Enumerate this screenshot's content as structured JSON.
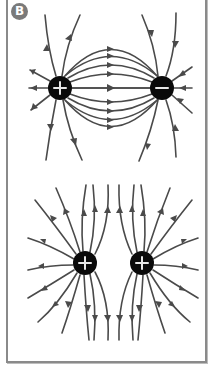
{
  "panel": {
    "label": "B",
    "border_color": "#8a8a8a",
    "badge_color": "#7a7a7a"
  },
  "diagram": {
    "line_color": "#4a4a4a",
    "charge_color": "#0a0a0a",
    "top_configuration": {
      "description": "Opposite charges (dipole)",
      "charges": [
        {
          "sign": "+",
          "x": 60,
          "y": 88
        },
        {
          "sign": "−",
          "x": 162,
          "y": 88
        }
      ]
    },
    "bottom_configuration": {
      "description": "Like charges (two positive)",
      "charges": [
        {
          "sign": "+",
          "x": 85,
          "y": 263
        },
        {
          "sign": "+",
          "x": 142,
          "y": 263
        }
      ]
    }
  }
}
